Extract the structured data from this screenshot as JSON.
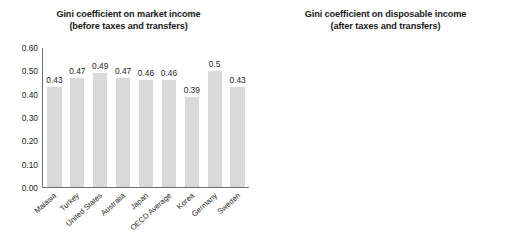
{
  "chart_data": [
    {
      "type": "bar",
      "panel": "left",
      "title": "Gini coefficient on market income",
      "subtitle": "(before taxes and transfers)",
      "title_line1": "Gini coefficient on market income",
      "title_line2": "(before taxes and transfers)",
      "xlabel": "",
      "ylabel": "",
      "ylim": [
        0,
        0.6
      ],
      "yticks": [
        "0.00",
        "0.10",
        "0.20",
        "0.30",
        "0.40",
        "0.50",
        "0.60"
      ],
      "ytick_values": [
        0,
        0.1,
        0.2,
        0.3,
        0.4,
        0.5,
        0.6
      ],
      "grid": false,
      "legend": "none",
      "bar_color": "#d9d9d9",
      "categories": [
        "Malasia",
        "Turkey",
        "United States",
        "Australia",
        "Japan",
        "OECD Average",
        "Korea",
        "Germany",
        "Sweden"
      ],
      "values": [
        0.43,
        0.47,
        0.49,
        0.47,
        0.46,
        0.46,
        0.39,
        0.5,
        0.43
      ],
      "data_labels": [
        "0.43",
        "0.47",
        "0.49",
        "0.47",
        "0.46",
        "0.46",
        "0.39",
        "0.5",
        "0.43"
      ]
    },
    {
      "type": "bar",
      "panel": "right",
      "title": "Gini coefficient on disposable income",
      "subtitle": "(after taxes and transfers)",
      "title_line1": "Gini coefficient on disposable income",
      "title_line2": "(after taxes and transfers)",
      "xlabel": "",
      "ylabel": "",
      "ylim": [
        0,
        0.5
      ],
      "yticks": [
        "0.00",
        "0.10",
        "0.20",
        "0.30",
        "0.40",
        "0.50"
      ],
      "ytick_values": [
        0,
        0.1,
        0.2,
        0.3,
        0.4,
        0.5
      ],
      "grid": false,
      "legend": "none",
      "bar_color": "#fbfbfb",
      "categories": [
        "Malasia",
        "Turkey",
        "United States",
        "Australia",
        "Japan",
        "OECD Average",
        "Korea",
        "Germany",
        "Sweden"
      ],
      "values": [
        0.41,
        0.41,
        0.35,
        0.34,
        0.33,
        0.32,
        0.31,
        0.3,
        0.28
      ],
      "data_labels": [
        "0.41",
        "0.41",
        "0.35",
        "0.34",
        "0.33",
        "0.32",
        "0.31",
        "0.30",
        "0.28"
      ]
    }
  ]
}
